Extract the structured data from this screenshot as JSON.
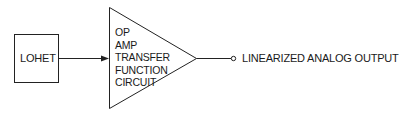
{
  "diagram": {
    "input_block": {
      "label": "LOHET"
    },
    "amplifier": {
      "lines": [
        "OP",
        "AMP",
        "TRANSFER",
        "FUNCTION",
        "CIRCUIT"
      ]
    },
    "output": {
      "label": "LINEARIZED ANALOG OUTPUT"
    },
    "colors": {
      "stroke": "#222222",
      "background": "#ffffff"
    }
  }
}
